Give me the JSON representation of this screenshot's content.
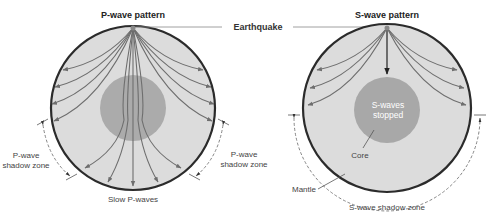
{
  "diagram": {
    "earthquake_label": "Earthquake",
    "colors": {
      "mantle": "#dcdcdc",
      "core": "#a8a8a8",
      "outline": "#2b2b2b",
      "rays": "#6e6e6e",
      "dashed": "#777777"
    },
    "p_wave": {
      "title": "P-wave pattern",
      "shadow_zone_left": [
        "P-wave",
        "shadow zone"
      ],
      "shadow_zone_right": [
        "P-wave",
        "shadow zone"
      ],
      "bottom_label": "Slow P-waves"
    },
    "s_wave": {
      "title": "S-wave pattern",
      "core_label_line1": "S-waves",
      "core_label_line2": "stopped",
      "core_label": "Core",
      "mantle_label": "Mantle",
      "shadow_zone_label": "S-wave shadow zone"
    }
  }
}
